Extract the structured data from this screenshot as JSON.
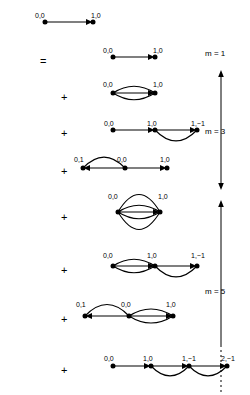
{
  "figure": {
    "operators": [
      {
        "symbol": "=",
        "x": 40,
        "y": 56
      },
      {
        "symbol": "+",
        "x": 61,
        "y": 92
      },
      {
        "symbol": "+",
        "x": 61,
        "y": 128
      },
      {
        "symbol": "+",
        "x": 61,
        "y": 166
      },
      {
        "symbol": "+",
        "x": 61,
        "y": 212
      },
      {
        "symbol": "+",
        "x": 61,
        "y": 265
      },
      {
        "symbol": "+",
        "x": 61,
        "y": 314
      },
      {
        "symbol": "+",
        "x": 61,
        "y": 365
      }
    ],
    "order_markers": [
      {
        "label": "m = 1",
        "x": 205,
        "y": 50
      },
      {
        "label": "m = 3",
        "x": 205,
        "y": 128
      },
      {
        "label": "m = 5",
        "x": 205,
        "y": 288
      }
    ],
    "axes": [
      {
        "name": "m3-arrow",
        "x": 221,
        "top": 70,
        "bottom": 190,
        "head_top": true,
        "head_bottom": true,
        "dashed_tail": false
      },
      {
        "name": "m5-arrow",
        "x": 221,
        "top": 200,
        "bottom": 345,
        "head_top": true,
        "head_bottom": false,
        "dashed_tail": true,
        "dash_bottom": 392
      }
    ],
    "diagrams": [
      {
        "id": "lhs",
        "name": "left-hand-side-edge",
        "x": 45,
        "y": 22,
        "spacing": 48,
        "nodes": [
          {
            "label": "0,0",
            "label_dx": -10,
            "label_dy": -10
          },
          {
            "label": "1,0",
            "label_dx": -2,
            "label_dy": -10
          }
        ],
        "links": [
          {
            "from": 0,
            "to": 1,
            "multiplicity": 1,
            "arrow": true,
            "style": "straight"
          }
        ]
      },
      {
        "id": "m1-t1",
        "name": "order-1-term-1",
        "x": 113,
        "y": 57,
        "spacing": 42,
        "nodes": [
          {
            "label": "0,0",
            "label_dx": -10,
            "label_dy": -10
          },
          {
            "label": "1,0",
            "label_dx": -2,
            "label_dy": -10
          }
        ],
        "links": [
          {
            "from": 0,
            "to": 1,
            "multiplicity": 1,
            "arrow": true,
            "style": "straight"
          }
        ]
      },
      {
        "id": "m3-t1",
        "name": "order-3-term-1",
        "x": 113,
        "y": 93,
        "spacing": 42,
        "nodes": [
          {
            "label": "0,0",
            "label_dx": -10,
            "label_dy": -12
          },
          {
            "label": "1,0",
            "label_dx": -2,
            "label_dy": -12
          }
        ],
        "links": [
          {
            "from": 0,
            "to": 1,
            "multiplicity": 3,
            "arrow": true,
            "style": "lens"
          }
        ]
      },
      {
        "id": "m3-t2",
        "name": "order-3-term-2",
        "x": 113,
        "y": 130,
        "spacing": 42,
        "nodes": [
          {
            "label": "0,0",
            "label_dx": -9,
            "label_dy": -10
          },
          {
            "label": "1,0",
            "label_dx": -8,
            "label_dy": -10
          },
          {
            "label": "1,−1",
            "label_dx": -6,
            "label_dy": -10
          }
        ],
        "links": [
          {
            "from": 0,
            "to": 1,
            "multiplicity": 1,
            "arrow": true,
            "style": "straight"
          },
          {
            "from": 1,
            "to": 2,
            "multiplicity": 2,
            "arrow": true,
            "style": "arc-down"
          }
        ]
      },
      {
        "id": "m3-t3",
        "name": "order-3-term-3",
        "x": 83,
        "y": 168,
        "spacing": 42,
        "nodes": [
          {
            "label": "0,1",
            "label_dx": -9,
            "label_dy": -12
          },
          {
            "label": "0,0",
            "label_dx": -8,
            "label_dy": -12
          },
          {
            "label": "1,0",
            "label_dx": -7,
            "label_dy": -12
          }
        ],
        "links": [
          {
            "from": 1,
            "to": 0,
            "multiplicity": 2,
            "arrow": true,
            "style": "arc-up"
          },
          {
            "from": 1,
            "to": 2,
            "multiplicity": 1,
            "arrow": true,
            "style": "straight"
          }
        ]
      },
      {
        "id": "m5-t1",
        "name": "order-5-term-1",
        "x": 118,
        "y": 212,
        "spacing": 42,
        "nodes": [
          {
            "label": "0,0",
            "label_dx": -10,
            "label_dy": -19
          },
          {
            "label": "1,0",
            "label_dx": -2,
            "label_dy": -19
          }
        ],
        "links": [
          {
            "from": 0,
            "to": 1,
            "multiplicity": 5,
            "arrow": true,
            "style": "lens"
          }
        ]
      },
      {
        "id": "m5-t2",
        "name": "order-5-term-2",
        "x": 113,
        "y": 266,
        "spacing": 42,
        "nodes": [
          {
            "label": "0,0",
            "label_dx": -10,
            "label_dy": -14
          },
          {
            "label": "1,0",
            "label_dx": -8,
            "label_dy": -14
          },
          {
            "label": "1,−1",
            "label_dx": -6,
            "label_dy": -14
          }
        ],
        "links": [
          {
            "from": 0,
            "to": 1,
            "multiplicity": 3,
            "arrow": true,
            "style": "lens"
          },
          {
            "from": 1,
            "to": 2,
            "multiplicity": 2,
            "arrow": true,
            "style": "arc-down"
          }
        ]
      },
      {
        "id": "m5-t3",
        "name": "order-5-term-3",
        "x": 85,
        "y": 316,
        "spacing": 44,
        "nodes": [
          {
            "label": "0,1",
            "label_dx": -9,
            "label_dy": -15
          },
          {
            "label": "0,0",
            "label_dx": -8,
            "label_dy": -15
          },
          {
            "label": "1,0",
            "label_dx": -7,
            "label_dy": -15
          }
        ],
        "links": [
          {
            "from": 1,
            "to": 0,
            "multiplicity": 2,
            "arrow": true,
            "style": "arc-up"
          },
          {
            "from": 1,
            "to": 2,
            "multiplicity": 3,
            "arrow": true,
            "style": "lens"
          }
        ]
      },
      {
        "id": "m5-t4",
        "name": "order-5-term-4",
        "x": 113,
        "y": 366,
        "spacing": 38,
        "nodes": [
          {
            "label": "0,0",
            "label_dx": -9,
            "label_dy": -11
          },
          {
            "label": "1,0",
            "label_dx": -8,
            "label_dy": -11
          },
          {
            "label": "1,−1",
            "label_dx": -7,
            "label_dy": -11
          },
          {
            "label": "2,−1",
            "label_dx": -6,
            "label_dy": -11
          }
        ],
        "links": [
          {
            "from": 0,
            "to": 1,
            "multiplicity": 1,
            "arrow": true,
            "style": "straight"
          },
          {
            "from": 1,
            "to": 2,
            "multiplicity": 2,
            "arrow": true,
            "style": "arc-down"
          },
          {
            "from": 2,
            "to": 3,
            "multiplicity": 2,
            "arrow": true,
            "style": "arc-down"
          }
        ]
      }
    ]
  }
}
